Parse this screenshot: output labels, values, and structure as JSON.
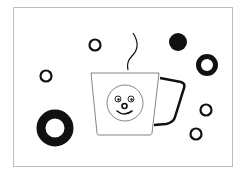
{
  "illustration": {
    "subject": "coffee cup with smiley face and decorative circles",
    "colors": {
      "ink": "#111111",
      "frame": "#bdbdbd",
      "background": "#ffffff"
    }
  }
}
